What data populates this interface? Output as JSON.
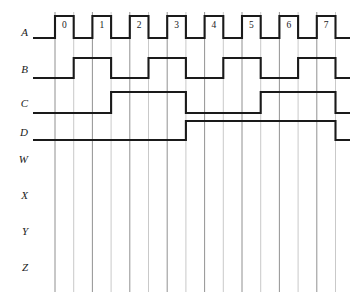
{
  "figure": {
    "type": "timing-diagram",
    "background_color": "#ffffff",
    "width": 358,
    "height": 307,
    "signal_color": "#1a1a1a",
    "gridline_color": "#808080",
    "gridline_count": 16,
    "gridline_start_x": 55,
    "gridline_spacing": 18.7,
    "gridline_top_y": 12,
    "gridline_bottom_y": 292
  },
  "signals": [
    {
      "name": "A",
      "label": "A",
      "row_y": 33,
      "high_y": 16,
      "low_y": 38,
      "kind": "clock",
      "description": "clock with 8 labeled high pulses",
      "lead_in_low_x": 33,
      "pulses": [
        {
          "label": "0",
          "start_x": 55,
          "end_x": 73.7
        },
        {
          "label": "1",
          "start_x": 92.4,
          "end_x": 111.1
        },
        {
          "label": "2",
          "start_x": 129.8,
          "end_x": 148.5
        },
        {
          "label": "3",
          "start_x": 167.2,
          "end_x": 185.9
        },
        {
          "label": "4",
          "start_x": 204.6,
          "end_x": 223.3
        },
        {
          "label": "5",
          "start_x": 242.0,
          "end_x": 260.7
        },
        {
          "label": "6",
          "start_x": 279.4,
          "end_x": 298.1
        },
        {
          "label": "7",
          "start_x": 316.8,
          "end_x": 335.5
        }
      ],
      "tail_end_x": 350
    },
    {
      "name": "B",
      "label": "B",
      "row_y": 70,
      "high_y": 58,
      "low_y": 78,
      "kind": "divide-by-2",
      "description": "toggles on each falling edge of A",
      "lead_in_low_x": 33,
      "transitions_x": [
        73.7,
        111.1,
        148.5,
        185.9,
        223.3,
        260.7,
        298.1,
        335.5
      ],
      "initial_state": "low",
      "tail_end_x": 350
    },
    {
      "name": "C",
      "label": "C",
      "row_y": 104,
      "high_y": 92,
      "low_y": 113,
      "kind": "divide-by-4",
      "description": "toggles on each falling edge of B",
      "lead_in_low_x": 33,
      "transitions_x": [
        111.1,
        185.9,
        260.7,
        335.5
      ],
      "initial_state": "low",
      "tail_end_x": 350
    },
    {
      "name": "D",
      "label": "D",
      "row_y": 133,
      "high_y": 121,
      "low_y": 140,
      "kind": "divide-by-8",
      "description": "toggles on each falling edge of C",
      "lead_in_low_x": 33,
      "transitions_x": [
        185.9,
        335.5
      ],
      "initial_state": "low",
      "tail_end_x": 350
    },
    {
      "name": "W",
      "label": "W",
      "row_y": 160,
      "kind": "blank",
      "description": "empty waveform row"
    },
    {
      "name": "X",
      "label": "X",
      "row_y": 196,
      "kind": "blank",
      "description": "empty waveform row"
    },
    {
      "name": "Y",
      "label": "Y",
      "row_y": 232,
      "kind": "blank",
      "description": "empty waveform row"
    },
    {
      "name": "Z",
      "label": "Z",
      "row_y": 268,
      "kind": "blank",
      "description": "empty waveform row"
    }
  ]
}
